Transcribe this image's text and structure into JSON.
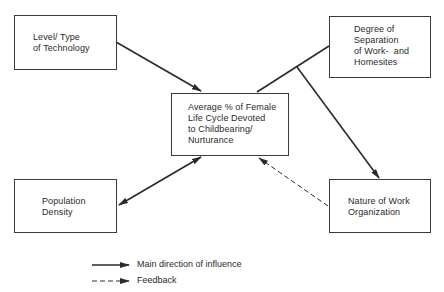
{
  "diagram": {
    "nodes": [
      {
        "id": "technology",
        "label": "Level/ Type\nof Technology"
      },
      {
        "id": "separation",
        "label": "Degree of\nSeparation\nof Work-  and\nHomesites"
      },
      {
        "id": "center",
        "label": "Average % of Female\nLife Cycle Devoted\nto Childbearing/\nNurturance"
      },
      {
        "id": "population",
        "label": "Population\nDensity"
      },
      {
        "id": "work_organization",
        "label": "Nature of Work\nOrganization"
      }
    ],
    "edges": [
      {
        "from": "technology",
        "to": "center",
        "type": "main"
      },
      {
        "from": "center",
        "to": "separation",
        "type": "main",
        "note": "line joining center and separation box"
      },
      {
        "from": "separation-link",
        "to": "work_organization",
        "type": "main"
      },
      {
        "from": "population",
        "to": "center",
        "type": "main",
        "bidirectional": true
      },
      {
        "from": "work_organization",
        "to": "center",
        "type": "feedback"
      }
    ],
    "legend": [
      {
        "style": "solid",
        "label": "Main direction of influence"
      },
      {
        "style": "dashed",
        "label": "Feedback"
      }
    ],
    "colors": {
      "line": "#2a2a2a",
      "box_border": "#3a3a3a",
      "background": "#ffffff"
    }
  }
}
